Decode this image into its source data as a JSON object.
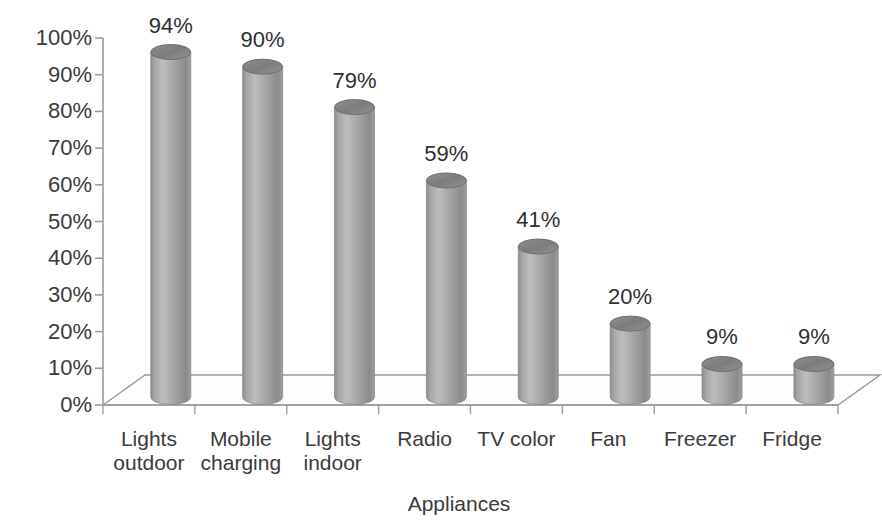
{
  "chart_data": {
    "type": "bar",
    "title": "",
    "subtitle": "",
    "xlabel": "Appliances",
    "ylabel": "",
    "categories": [
      "Lights outdoor",
      "Mobile charging",
      "Lights indoor",
      "Radio",
      "TV color",
      "Fan",
      "Freezer",
      "Fridge"
    ],
    "values": [
      94,
      90,
      79,
      59,
      41,
      20,
      9,
      9
    ],
    "value_labels": [
      "94%",
      "90%",
      "79%",
      "59%",
      "41%",
      "20%",
      "9%",
      "9%"
    ],
    "category_label_lines": [
      [
        "Lights",
        "outdoor"
      ],
      [
        "Mobile",
        "charging"
      ],
      [
        "Lights",
        "indoor"
      ],
      [
        "Radio"
      ],
      [
        "TV color"
      ],
      [
        "Fan"
      ],
      [
        "Freezer"
      ],
      [
        "Fridge"
      ]
    ],
    "ylim": [
      0,
      100
    ],
    "ytick_labels": [
      "100%",
      "90%",
      "80%",
      "70%",
      "60%",
      "50%",
      "40%",
      "30%",
      "20%",
      "10%",
      "0%"
    ],
    "ytick_values": [
      100,
      90,
      80,
      70,
      60,
      50,
      40,
      30,
      20,
      10,
      0
    ],
    "grid": false,
    "legend": "none",
    "style": "3d-cylinder",
    "colors": {
      "bar_fill": "#9a9a9a",
      "bar_fill_light": "#c0c0c0",
      "bar_fill_dark": "#7d7d7d",
      "bar_top": "#8a8a8a",
      "bar_top_rim": "#6e6e6e",
      "axis": "#9c9c9c",
      "floor_edge": "#8f8f8f",
      "text": "#3b3b3b",
      "background": "#ffffff"
    }
  }
}
